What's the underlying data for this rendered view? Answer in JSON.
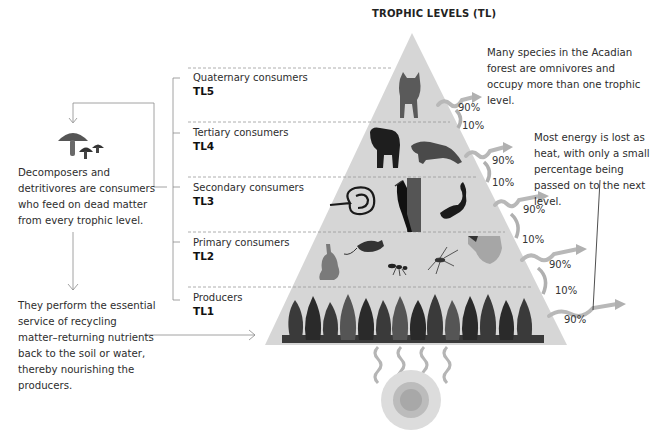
{
  "title": "TROPHIC LEVELS (TL)",
  "levels": [
    {
      "name": "Quaternary consumers",
      "code": "TL5",
      "organisms": [
        "bobcat"
      ]
    },
    {
      "name": "Tertiary consumers",
      "code": "TL4",
      "organisms": [
        "black bear",
        "marten"
      ]
    },
    {
      "name": "Secondary consumers",
      "code": "TL3",
      "organisms": [
        "snake",
        "woodpecker",
        "salamander"
      ]
    },
    {
      "name": "Primary consumers",
      "code": "TL2",
      "organisms": [
        "hare",
        "mouse",
        "ant",
        "mosquito",
        "flying squirrel"
      ]
    },
    {
      "name": "Producers",
      "code": "TL1",
      "organisms": [
        "trees"
      ]
    }
  ],
  "notes": {
    "omnivores": "Many species in the Acadian forest are omnivores and occupy more than one trophic level.",
    "energy_loss": "Most energy is lost as heat, with only a small percentage being passed on to the next level.",
    "decomposers": "Decomposers and detritivores are consumers who feed on dead matter from every trophic level.",
    "recycling": "They perform the essential service of recycling matter–returning nutrients back to the soil or water, thereby nourishing the producers."
  },
  "energy": {
    "lost_labels": [
      "90%",
      "90%",
      "90%",
      "90%",
      "90%"
    ],
    "passed_labels": [
      "10%",
      "10%",
      "10%",
      "10%"
    ]
  },
  "icons": {
    "decomposer": "mushroom-icon",
    "energy_source": "sun-icon"
  },
  "colors": {
    "pyramid": "#d4d4d4",
    "arrow": "#b8b8b8",
    "line": "#8a8a8a",
    "text": "#2d2d2d"
  }
}
